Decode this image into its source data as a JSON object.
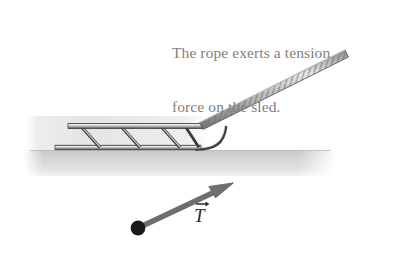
{
  "figure": {
    "caption": {
      "line1": "The rope exerts a tension",
      "line2": "force on the sled.",
      "color": "#807f80"
    },
    "vector": {
      "symbol": "T",
      "name": "tension-vector",
      "arrow_color": "#6e6e6e",
      "dot_color": "#1a1a1a",
      "tail": {
        "x": 138,
        "y": 228
      },
      "tip": {
        "x": 233,
        "y": 183
      }
    },
    "scene": {
      "ground_color": "#d2d2d2",
      "backdrop_color": "#e3e3e3",
      "sled_color": "#8c8c8c",
      "sled_outline": "#3a3a3a",
      "rope_color": "#9a9a9a",
      "rope_outline": "#6b6b6b"
    },
    "objects": {
      "ground_label": "ground",
      "sled_label": "sled",
      "rope_label": "rope",
      "backdrop_label": "snow-backdrop"
    }
  }
}
